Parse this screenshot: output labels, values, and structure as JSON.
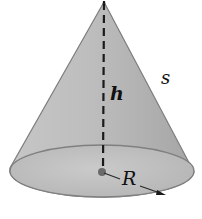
{
  "diagram": {
    "shape": "right circular cone",
    "labels": {
      "height": "h",
      "slant_height": "s",
      "radius": "R"
    },
    "colors": {
      "surface": "#b8b8b8",
      "surface_dark": "#9c9c9c",
      "base_fill": "#c4c4c4",
      "outline": "#7a7a7a",
      "dash_line": "#1a1a1a",
      "center_dot": "#6a6a6a"
    }
  }
}
